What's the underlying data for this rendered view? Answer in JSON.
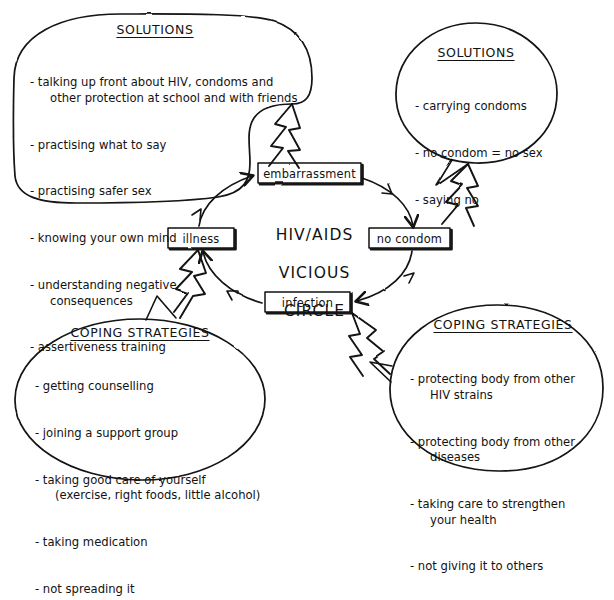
{
  "diagram": {
    "center_title_lines": [
      "HIV/AIDS",
      "VICIOUS",
      "CIRCLE"
    ],
    "nodes": [
      {
        "id": "embarrassment",
        "label": "embarrassment"
      },
      {
        "id": "no-condom",
        "label": "no condom"
      },
      {
        "id": "infection",
        "label": "infection"
      },
      {
        "id": "illness",
        "label": "illness"
      }
    ],
    "cycle_order": [
      "illness",
      "embarrassment",
      "no condom",
      "infection",
      "illness"
    ],
    "cycle_direction": "clockwise",
    "callouts": [
      {
        "id": "solutions-embarrassment",
        "title": "SOLUTIONS",
        "attached_to": "embarrassment",
        "items": [
          "- talking up front about HIV, condoms and\n   other protection at school and with friends",
          "- practising what to say",
          "- practising safer sex",
          "- knowing your own mind",
          "- understanding negative\n   consequences",
          "- assertiveness training"
        ]
      },
      {
        "id": "solutions-no-condom",
        "title": "SOLUTIONS",
        "attached_to": "no condom",
        "items": [
          "- carrying condoms",
          "- no condom = no sex",
          "- saying no"
        ]
      },
      {
        "id": "coping-illness",
        "title": "COPING STRATEGIES",
        "attached_to": "illness",
        "items": [
          "- getting counselling",
          "- joining a support group",
          "- taking good care of yourself\n   (exercise, right foods, little alcohol)",
          "- taking medication",
          "- not spreading it"
        ]
      },
      {
        "id": "coping-infection",
        "title": "COPING STRATEGIES",
        "attached_to": "infection",
        "items": [
          "- protecting body from other\n   HIV strains",
          "- protecting body from other\n   diseases",
          "- taking care to strengthen\n   your health",
          "- not giving it to others"
        ]
      }
    ],
    "colors": {
      "ink": "#121212",
      "paper": "#ffffff"
    }
  }
}
